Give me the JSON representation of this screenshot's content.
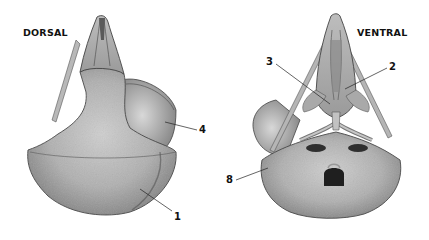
{
  "figure": {
    "views": [
      {
        "id": "dorsal",
        "title": "DORSAL"
      },
      {
        "id": "ventral",
        "title": "VENTRAL"
      }
    ],
    "labels": [
      {
        "view": "dorsal",
        "number": "4"
      },
      {
        "view": "dorsal",
        "number": "1"
      },
      {
        "view": "ventral",
        "number": "3"
      },
      {
        "view": "ventral",
        "number": "2"
      },
      {
        "view": "ventral",
        "number": "8"
      }
    ],
    "colors": {
      "bone_light": "#c9c9c9",
      "bone_mid": "#a8a8a8",
      "bone_dark": "#6e6e6e",
      "shadow": "#3c3c3c",
      "label": "#111111",
      "background": "#ffffff"
    }
  }
}
